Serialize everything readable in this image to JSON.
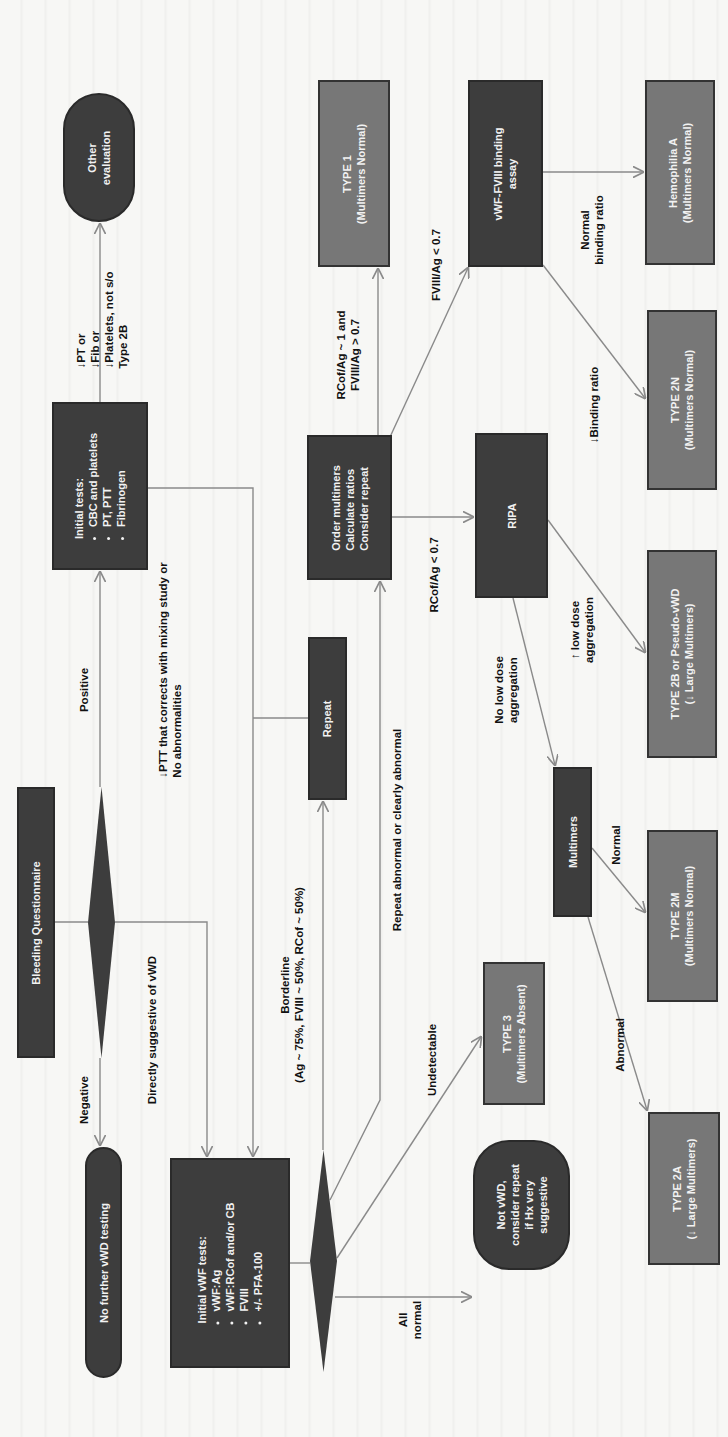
{
  "diagram": {
    "orientation": "rotated 90 degrees counter-clockwise",
    "colors": {
      "process_fill": "#3d3d3d",
      "outcome_fill": "#777777",
      "edge": "#8a8a8a",
      "background": "#f7f7f5",
      "text_on_box": "#f2f2f2",
      "label_text": "#111111"
    },
    "nodes": {
      "bleeding_questionnaire": "Bleeding Questionnaire",
      "other_evaluation": {
        "line1": "Other",
        "line2": "evaluation"
      },
      "initial_tests": {
        "title": "Initial tests:",
        "items": [
          "CBC and platelets",
          "PT, PTT",
          "Fibrinogen"
        ]
      },
      "no_further_testing": "No further vWD testing",
      "initial_vwf_tests": {
        "title": "Initial vWF tests:",
        "items": [
          "vWF:Ag",
          "vWF:RCof and/or CB",
          "FVIII",
          "+/- PFA-100"
        ]
      },
      "repeat": "Repeat",
      "order_multimers": {
        "line1": "Order multimers",
        "line2": "Calculate ratios",
        "line3": "Consider repeat"
      },
      "type1": {
        "line1": "TYPE 1",
        "line2": "(Multimers Normal)"
      },
      "vwf_fviii_binding": {
        "line1": "vWF-FVIII binding",
        "line2": "assay"
      },
      "hemophilia_a": {
        "line1": "Hemophilia A",
        "line2": "(Multimers Normal)"
      },
      "type2n": {
        "line1": "TYPE 2N",
        "line2": "(Multimers Normal)"
      },
      "ripa": "RIPA",
      "type2b": {
        "line1": "TYPE 2B or Pseudo-vWD",
        "line2": "(↓ Large Multimers)"
      },
      "multimers": "Multimers",
      "type2m": {
        "line1": "TYPE 2M",
        "line2": "(Multimers Normal)"
      },
      "type3": {
        "line1": "TYPE 3",
        "line2": "(Multimers Absent)"
      },
      "not_vwd": {
        "line1": "Not vWD,",
        "line2": "consider repeat",
        "line3": "if Hx very",
        "line4": "suggestive"
      },
      "type2a": {
        "line1": "TYPE 2A",
        "line2": "(↓ Large Multimers)"
      }
    },
    "edge_labels": {
      "negative": "Negative",
      "positive": "Positive",
      "directly_suggestive": "Directly suggestive of vWD",
      "ptt_corrects": {
        "line1": "↓PTT that corrects with mixing study or",
        "line2": "No abnormalities"
      },
      "abnormal_initial": {
        "line1": "↓PT or",
        "line2": "↓Fib or",
        "line3": "↓Platelets, not s/o",
        "line4": "Type 2B"
      },
      "borderline": {
        "line1": "Borderline",
        "line2": "(Ag ~ 75%, FVIII ~ 50%, RCof ~ 50%)"
      },
      "repeat_abnormal": "Repeat abnormal or clearly abnormal",
      "undetectable": "Undetectable",
      "all_normal": {
        "line1": "All",
        "line2": "normal"
      },
      "ratio_normal": {
        "line1": "RCof/Ag ~ 1 and",
        "line2": "FVIII/Ag > 0.7"
      },
      "fviii_ag_low": "FVIII/Ag < 0.7",
      "rcof_ag_low": "RCof/Ag < 0.7",
      "normal_binding": {
        "line1": "Normal",
        "line2": "binding ratio"
      },
      "low_binding": "↓Binding ratio",
      "high_low_dose": {
        "line1": "↑ low dose",
        "line2": "aggregation"
      },
      "no_low_dose": {
        "line1": "No low dose",
        "line2": "aggregation"
      },
      "multimers_normal": "Normal",
      "multimers_abnormal": "Abnormal"
    }
  }
}
